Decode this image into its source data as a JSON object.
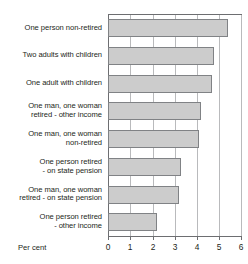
{
  "chart_data": {
    "type": "bar",
    "orientation": "horizontal",
    "title": "",
    "xlabel": "Per cent",
    "ylabel": "",
    "xlim": [
      0,
      6
    ],
    "xticks": [
      "0",
      "1",
      "2",
      "3",
      "4",
      "5",
      "6"
    ],
    "grid": true,
    "legend": false,
    "bar_color": "#cccccc",
    "bar_border_color": "#808285",
    "axis_color": "#6d6e71",
    "gridline_color": "#b9babc",
    "categories": [
      "One person non-retired",
      "Two adults with children",
      "One adult with children",
      "One man, one woman retired - other income",
      "One man, one woman non-retired",
      "One person retired - on state pension",
      "One man, one woman retired - on state pension",
      "One person retired - other income"
    ],
    "values": [
      5.4,
      4.8,
      4.7,
      4.2,
      4.1,
      3.3,
      3.2,
      2.2
    ]
  },
  "rows": [
    {
      "label_lines": [
        "One person non-retired"
      ],
      "value": 5.4
    },
    {
      "label_lines": [
        "Two adults with children"
      ],
      "value": 4.8
    },
    {
      "label_lines": [
        "One adult with children"
      ],
      "value": 4.7
    },
    {
      "label_lines": [
        "One man, one woman",
        "retired - other income"
      ],
      "value": 4.2
    },
    {
      "label_lines": [
        "One man, one woman",
        "non-retired"
      ],
      "value": 4.1
    },
    {
      "label_lines": [
        "One person retired",
        "- on state pension"
      ],
      "value": 3.3
    },
    {
      "label_lines": [
        "One man, one woman",
        "retired - on state pension"
      ],
      "value": 3.2
    },
    {
      "label_lines": [
        "One person retired",
        "- other income"
      ],
      "value": 2.2
    }
  ],
  "axis": {
    "caption": "Per cent",
    "ticks": [
      "0",
      "1",
      "2",
      "3",
      "4",
      "5",
      "6"
    ]
  },
  "title_fragment": ""
}
